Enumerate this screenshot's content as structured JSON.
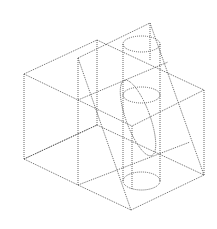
{
  "diagram": {
    "title": "",
    "stroke_color": "#555555",
    "background": "#ffffff",
    "edges": [
      {
        "name": "top-left-back",
        "x1": 24,
        "y1": 74,
        "x2": 97,
        "y2": 40
      },
      {
        "name": "top-back-right",
        "x1": 97,
        "y1": 40,
        "x2": 204,
        "y2": 90
      },
      {
        "name": "top-right-front",
        "x1": 204,
        "y1": 90,
        "x2": 132,
        "y2": 126
      },
      {
        "name": "top-left-front",
        "x1": 24,
        "y1": 74,
        "x2": 132,
        "y2": 126
      },
      {
        "name": "left-vertical",
        "x1": 24,
        "y1": 74,
        "x2": 24,
        "y2": 159
      },
      {
        "name": "right-vertical",
        "x1": 204,
        "y1": 90,
        "x2": 204,
        "y2": 175
      },
      {
        "name": "back-vertical",
        "x1": 97,
        "y1": 40,
        "x2": 97,
        "y2": 125
      },
      {
        "name": "bottom-left-back",
        "x1": 24,
        "y1": 159,
        "x2": 97,
        "y2": 125
      },
      {
        "name": "bottom-left-front",
        "x1": 24,
        "y1": 159,
        "x2": 78,
        "y2": 185
      },
      {
        "name": "bottom-front",
        "x1": 78,
        "y1": 185,
        "x2": 131,
        "y2": 210
      },
      {
        "name": "bottom-right",
        "x1": 131,
        "y1": 210,
        "x2": 204,
        "y2": 175
      },
      {
        "name": "bottom-back-right",
        "x1": 97,
        "y1": 125,
        "x2": 204,
        "y2": 175
      },
      {
        "name": "bottom-mid",
        "x1": 78,
        "y1": 185,
        "x2": 190,
        "y2": 142
      },
      {
        "name": "inner-vertical",
        "x1": 78,
        "y1": 58,
        "x2": 78,
        "y2": 185
      },
      {
        "name": "plane-top-edge",
        "x1": 78,
        "y1": 58,
        "x2": 150,
        "y2": 23
      },
      {
        "name": "plane-apex-vertical",
        "x1": 150,
        "y1": 23,
        "x2": 150,
        "y2": 60
      },
      {
        "name": "plane-right-slant",
        "x1": 150,
        "y1": 23,
        "x2": 204,
        "y2": 175
      },
      {
        "name": "plane-left-slant",
        "x1": 78,
        "y1": 58,
        "x2": 131,
        "y2": 210
      },
      {
        "name": "mid-left-edge",
        "x1": 78,
        "y1": 100,
        "x2": 168,
        "y2": 62
      },
      {
        "name": "mid-left-lower",
        "x1": 24,
        "y1": 159,
        "x2": 97,
        "y2": 125
      },
      {
        "name": "front-vertical",
        "x1": 132,
        "y1": 126,
        "x2": 132,
        "y2": 190
      }
    ],
    "cylinder": {
      "left_x": 123,
      "right_x": 160,
      "top_y": 44,
      "bottom_y": 181,
      "ellipses": [
        {
          "name": "cylinder-top-ellipse",
          "cx": 141.5,
          "cy": 44,
          "rx": 18.5,
          "ry": 8
        },
        {
          "name": "cylinder-mid-ellipse",
          "cx": 141.5,
          "cy": 95,
          "rx": 18.5,
          "ry": 8
        },
        {
          "name": "cylinder-bottom-ellipse",
          "cx": 141.5,
          "cy": 181,
          "rx": 18.5,
          "ry": 9
        }
      ],
      "section_ellipse": {
        "name": "inclined-section-ellipse",
        "cx": 138,
        "cy": 118,
        "rx": 12,
        "ry": 40,
        "rotate": -20
      }
    }
  }
}
